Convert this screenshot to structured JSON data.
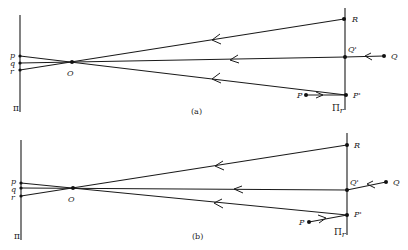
{
  "figure": {
    "panels": [
      {
        "id": "a",
        "caption": "(a)",
        "left_plane": {
          "label": "π",
          "x": 20,
          "y1": 15,
          "y2": 112
        },
        "right_plane": {
          "label": "Π",
          "subscript": "r",
          "x": 345,
          "y1": 8,
          "y2": 110
        },
        "pinhole": {
          "label": "O",
          "x": 72,
          "y": 62
        },
        "image_points": [
          {
            "label": "p",
            "x": 20,
            "y": 56
          },
          {
            "label": "q",
            "x": 20,
            "y": 63
          },
          {
            "label": "r",
            "x": 20,
            "y": 70
          }
        ],
        "scene_points": [
          {
            "label": "R",
            "x": 344,
            "y": 19
          },
          {
            "label": "Q'",
            "x": 345,
            "y": 57
          },
          {
            "label": "P'",
            "x": 346,
            "y": 95
          },
          {
            "label": "Q",
            "x": 384,
            "y": 56
          },
          {
            "label": "P",
            "x": 306,
            "y": 95
          }
        ]
      },
      {
        "id": "b",
        "caption": "(b)",
        "left_plane": {
          "label": "π",
          "x": 21,
          "y1": 140,
          "y2": 240
        },
        "right_plane": {
          "label": "Π",
          "subscript": "r",
          "x": 347,
          "y1": 133,
          "y2": 235
        },
        "pinhole": {
          "label": "O",
          "x": 73,
          "y": 188
        },
        "image_points": [
          {
            "label": "p",
            "x": 21,
            "y": 183
          },
          {
            "label": "q",
            "x": 21,
            "y": 188
          },
          {
            "label": "r",
            "x": 21,
            "y": 196
          }
        ],
        "scene_points": [
          {
            "label": "R",
            "x": 347,
            "y": 145
          },
          {
            "label": "Q'",
            "x": 347,
            "y": 190
          },
          {
            "label": "P'",
            "x": 347,
            "y": 215
          },
          {
            "label": "Q",
            "x": 386,
            "y": 182
          },
          {
            "label": "P",
            "x": 309,
            "y": 222
          }
        ]
      }
    ]
  },
  "labels": {
    "a": {
      "p": "p",
      "q": "q",
      "r": "r",
      "O": "O",
      "R": "R",
      "Qp": "Q'",
      "Q": "Q",
      "Pp": "P'",
      "P": "P",
      "pi": "π",
      "Pi": "Π",
      "sub": "r",
      "caption": "(a)"
    },
    "b": {
      "p": "p",
      "q": "q",
      "r": "r",
      "O": "O",
      "R": "R",
      "Qp": "Q'",
      "Q": "Q",
      "Pp": "P'",
      "P": "P",
      "pi": "π",
      "Pi": "Π",
      "sub": "r",
      "caption": "(b)"
    }
  }
}
